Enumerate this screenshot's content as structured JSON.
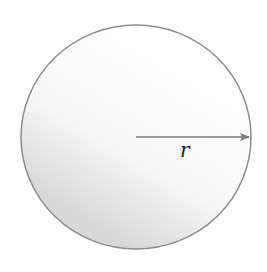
{
  "diagram": {
    "shape": "circle",
    "center": {
      "x": 136,
      "y": 137
    },
    "radius_x": 115,
    "radius_y": 112,
    "stroke_color": "#8a8a8a",
    "fill_gradient": {
      "light": "#ffffff",
      "shade": "#d9d9d9"
    },
    "radius_arrow": {
      "from": {
        "x": 136,
        "y": 137
      },
      "to": {
        "x": 250,
        "y": 137
      },
      "color": "#7a7a7a",
      "label": "r"
    }
  }
}
